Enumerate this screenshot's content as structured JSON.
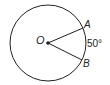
{
  "diagram": {
    "center_label": "O",
    "point_a_label": "A",
    "point_b_label": "B",
    "arc_measure": "50°",
    "stroke_color": "#231f20"
  }
}
